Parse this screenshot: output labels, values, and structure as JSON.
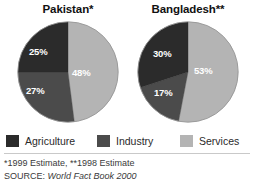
{
  "chart_data": [
    {
      "type": "pie",
      "title": "Pakistan*",
      "categories": [
        "Agriculture",
        "Industry",
        "Services"
      ],
      "values": [
        25,
        27,
        48
      ],
      "labels": [
        "25%",
        "27%",
        "48%"
      ],
      "colors": [
        "#2b2b2b",
        "#4b4b4b",
        "#b4b4b4"
      ],
      "legend_position": "bottom",
      "start_angle_deg": 0,
      "direction": "clockwise"
    },
    {
      "type": "pie",
      "title": "Bangladesh**",
      "categories": [
        "Agriculture",
        "Industry",
        "Services"
      ],
      "values": [
        30,
        17,
        53
      ],
      "labels": [
        "30%",
        "17%",
        "53%"
      ],
      "colors": [
        "#2b2b2b",
        "#4b4b4b",
        "#b4b4b4"
      ],
      "legend_position": "bottom",
      "start_angle_deg": 0,
      "direction": "clockwise"
    }
  ],
  "charts": [
    {
      "title": "Pakistan*",
      "slices": [
        {
          "name": "Services",
          "value": 48,
          "label": "48%",
          "color": "#b4b4b4"
        },
        {
          "name": "Industry",
          "value": 27,
          "label": "27%",
          "color": "#4b4b4b"
        },
        {
          "name": "Agriculture",
          "value": 25,
          "label": "25%",
          "color": "#2b2b2b"
        }
      ]
    },
    {
      "title": "Bangladesh**",
      "slices": [
        {
          "name": "Services",
          "value": 53,
          "label": "53%",
          "color": "#b4b4b4"
        },
        {
          "name": "Industry",
          "value": 17,
          "label": "17%",
          "color": "#4b4b4b"
        },
        {
          "name": "Agriculture",
          "value": 30,
          "label": "30%",
          "color": "#2b2b2b"
        }
      ]
    }
  ],
  "legend": {
    "items": [
      {
        "label": "Agriculture",
        "color": "#2b2b2b"
      },
      {
        "label": "Industry",
        "color": "#4b4b4b"
      },
      {
        "label": "Services",
        "color": "#b4b4b4"
      }
    ]
  },
  "footnotes": {
    "estimates": "*1999 Estimate, **1998 Estimate",
    "source_label": "SOURCE: ",
    "source_title": "World Fact Book 2000"
  }
}
